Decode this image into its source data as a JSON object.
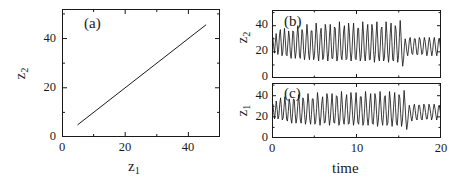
{
  "figure": {
    "width": 466,
    "height": 183,
    "background": "#ffffff",
    "line_color": "#1a1a1a"
  },
  "chart_data": [
    {
      "type": "line",
      "panel_label": "(a)",
      "title": "",
      "xlabel": "z_1",
      "ylabel": "z_2",
      "xlabel_text": "z",
      "xlabel_sub": "1",
      "ylabel_text": "z",
      "ylabel_sub": "2",
      "xlim": [
        0,
        50
      ],
      "ylim": [
        0,
        52
      ],
      "xticks": [
        0,
        20,
        40
      ],
      "xtick_labels": [
        "0",
        "20",
        "40"
      ],
      "xticks_minor": [
        10,
        30,
        50
      ],
      "yticks": [
        0,
        20,
        40
      ],
      "ytick_labels": [
        "0",
        "20",
        "40"
      ],
      "yticks_minor": [
        10,
        30,
        50
      ],
      "grid": false,
      "legend": "none",
      "series": [
        {
          "name": "z2 vs z1",
          "x": [
            5.0,
            45.5
          ],
          "values": [
            5.0,
            45.5
          ]
        }
      ]
    },
    {
      "type": "line",
      "panel_label": "(b)",
      "title": "",
      "xlabel": "",
      "ylabel": "z_2",
      "ylabel_text": "z",
      "ylabel_sub": "2",
      "xlim": [
        0,
        20
      ],
      "ylim": [
        0,
        52
      ],
      "xticks": [
        0,
        10,
        20
      ],
      "xtick_labels": [
        "",
        "",
        ""
      ],
      "xticks_minor": [
        5,
        15
      ],
      "yticks": [
        0,
        20,
        40
      ],
      "ytick_labels": [
        "0",
        "20",
        "40"
      ],
      "yticks_minor": [
        10,
        30,
        50
      ],
      "grid": false,
      "legend": "none",
      "series": [
        {
          "name": "z2(t)",
          "x": [
            0.0,
            0.1,
            0.2,
            0.3,
            0.4,
            0.5,
            0.6,
            0.7,
            0.8,
            0.9,
            1.0,
            1.1,
            1.2,
            1.3,
            1.4,
            1.5,
            1.6,
            1.7,
            1.8,
            1.9,
            2.0,
            2.1,
            2.2,
            2.3,
            2.4,
            2.5,
            2.6,
            2.7,
            2.8,
            2.9,
            3.0,
            3.1,
            3.2,
            3.3,
            3.4,
            3.5,
            3.6,
            3.7,
            3.8,
            3.9,
            4.0,
            4.1,
            4.2,
            4.3,
            4.4,
            4.5,
            4.6,
            4.7,
            4.8,
            4.9,
            5.0,
            5.1,
            5.2,
            5.3,
            5.4,
            5.5,
            5.6,
            5.7,
            5.8,
            5.9,
            6.0,
            6.1,
            6.2,
            6.3,
            6.4,
            6.5,
            6.6,
            6.7,
            6.8,
            6.9,
            7.0,
            7.1,
            7.2,
            7.3,
            7.4,
            7.5,
            7.6,
            7.7,
            7.8,
            7.9,
            8.0,
            8.1,
            8.2,
            8.3,
            8.4,
            8.5,
            8.6,
            8.7,
            8.8,
            8.9,
            9.0,
            9.1,
            9.2,
            9.3,
            9.4,
            9.5,
            9.6,
            9.7,
            9.8,
            9.9,
            10.0,
            10.1,
            10.2,
            10.3,
            10.4,
            10.5,
            10.6,
            10.7,
            10.8,
            10.9,
            11.0,
            11.1,
            11.2,
            11.3,
            11.4,
            11.5,
            11.6,
            11.7,
            11.8,
            11.9,
            12.0,
            12.1,
            12.2,
            12.3,
            12.4,
            12.5,
            12.6,
            12.7,
            12.8,
            12.9,
            13.0,
            13.1,
            13.2,
            13.3,
            13.4,
            13.5,
            13.6,
            13.7,
            13.8,
            13.9,
            14.0,
            14.1,
            14.2,
            14.3,
            14.4,
            14.5,
            14.6,
            14.7,
            14.8,
            14.9,
            15.0,
            15.1,
            15.2,
            15.3,
            15.4,
            15.5,
            15.6,
            15.7,
            15.8,
            15.9,
            16.0,
            16.1,
            16.2,
            16.3,
            16.4,
            16.5,
            16.6,
            16.7,
            16.8,
            16.9,
            17.0,
            17.1,
            17.2,
            17.3,
            17.4,
            17.5,
            17.6,
            17.7,
            17.8,
            17.9,
            18.0,
            18.1,
            18.2,
            18.3,
            18.4,
            18.5,
            18.6,
            18.7,
            18.8,
            18.9,
            19.0,
            19.1,
            19.2,
            19.3,
            19.4,
            19.5,
            19.6,
            19.7,
            19.8,
            19.9,
            20.0
          ],
          "values": [
            28,
            31,
            24,
            19,
            27,
            34,
            26,
            18,
            22,
            33,
            37,
            27,
            17,
            20,
            30,
            38,
            29,
            18,
            17,
            26,
            36,
            31,
            19,
            15,
            24,
            36,
            35,
            22,
            15,
            20,
            32,
            40,
            30,
            17,
            15,
            25,
            37,
            34,
            21,
            14,
            19,
            31,
            41,
            32,
            18,
            14,
            23,
            36,
            36,
            23,
            14,
            17,
            29,
            42,
            34,
            19,
            13,
            21,
            34,
            38,
            25,
            14,
            16,
            27,
            41,
            36,
            21,
            13,
            19,
            32,
            41,
            28,
            15,
            15,
            25,
            39,
            38,
            23,
            13,
            17,
            30,
            43,
            31,
            17,
            14,
            22,
            36,
            40,
            26,
            14,
            15,
            27,
            42,
            35,
            20,
            13,
            19,
            33,
            42,
            29,
            15,
            14,
            24,
            38,
            38,
            23,
            13,
            16,
            29,
            43,
            33,
            18,
            13,
            21,
            35,
            41,
            27,
            14,
            14,
            26,
            41,
            36,
            21,
            12,
            18,
            32,
            43,
            30,
            16,
            13,
            23,
            37,
            39,
            24,
            13,
            15,
            28,
            43,
            34,
            19,
            12,
            20,
            34,
            42,
            28,
            14,
            13,
            25,
            40,
            37,
            22,
            12,
            17,
            31,
            44,
            32,
            17,
            9,
            14,
            24,
            30,
            26,
            20,
            17,
            22,
            29,
            31,
            25,
            19,
            18,
            24,
            30,
            30,
            24,
            18,
            18,
            25,
            31,
            29,
            23,
            18,
            19,
            26,
            31,
            28,
            22,
            17,
            20,
            27,
            31,
            27,
            21,
            17,
            21,
            28,
            31,
            26,
            20,
            17,
            22,
            29,
            30,
            25,
            19
          ]
        }
      ]
    },
    {
      "type": "line",
      "panel_label": "(c)",
      "title": "",
      "xlabel": "time",
      "ylabel": "z_1",
      "ylabel_text": "z",
      "ylabel_sub": "1",
      "xlim": [
        0,
        20
      ],
      "ylim": [
        0,
        52
      ],
      "xticks": [
        0,
        10,
        20
      ],
      "xtick_labels": [
        "0",
        "10",
        "20"
      ],
      "xticks_minor": [
        5,
        15
      ],
      "yticks": [
        0,
        20,
        40
      ],
      "ytick_labels": [
        "0",
        "20",
        "40"
      ],
      "yticks_minor": [
        10,
        30,
        50
      ],
      "grid": false,
      "legend": "none",
      "series": [
        {
          "name": "z1(t)",
          "x": [
            0.0,
            0.1,
            0.2,
            0.3,
            0.4,
            0.5,
            0.6,
            0.7,
            0.8,
            0.9,
            1.0,
            1.1,
            1.2,
            1.3,
            1.4,
            1.5,
            1.6,
            1.7,
            1.8,
            1.9,
            2.0,
            2.1,
            2.2,
            2.3,
            2.4,
            2.5,
            2.6,
            2.7,
            2.8,
            2.9,
            3.0,
            3.1,
            3.2,
            3.3,
            3.4,
            3.5,
            3.6,
            3.7,
            3.8,
            3.9,
            4.0,
            4.1,
            4.2,
            4.3,
            4.4,
            4.5,
            4.6,
            4.7,
            4.8,
            4.9,
            5.0,
            5.1,
            5.2,
            5.3,
            5.4,
            5.5,
            5.6,
            5.7,
            5.8,
            5.9,
            6.0,
            6.1,
            6.2,
            6.3,
            6.4,
            6.5,
            6.6,
            6.7,
            6.8,
            6.9,
            7.0,
            7.1,
            7.2,
            7.3,
            7.4,
            7.5,
            7.6,
            7.7,
            7.8,
            7.9,
            8.0,
            8.1,
            8.2,
            8.3,
            8.4,
            8.5,
            8.6,
            8.7,
            8.8,
            8.9,
            9.0,
            9.1,
            9.2,
            9.3,
            9.4,
            9.5,
            9.6,
            9.7,
            9.8,
            9.9,
            10.0,
            10.1,
            10.2,
            10.3,
            10.4,
            10.5,
            10.6,
            10.7,
            10.8,
            10.9,
            11.0,
            11.1,
            11.2,
            11.3,
            11.4,
            11.5,
            11.6,
            11.7,
            11.8,
            11.9,
            12.0,
            12.1,
            12.2,
            12.3,
            12.4,
            12.5,
            12.6,
            12.7,
            12.8,
            12.9,
            13.0,
            13.1,
            13.2,
            13.3,
            13.4,
            13.5,
            13.6,
            13.7,
            13.8,
            13.9,
            14.0,
            14.1,
            14.2,
            14.3,
            14.4,
            14.5,
            14.6,
            14.7,
            14.8,
            14.9,
            15.0,
            15.1,
            15.2,
            15.3,
            15.4,
            15.5,
            15.6,
            15.7,
            15.8,
            15.9,
            16.0,
            16.1,
            16.2,
            16.3,
            16.4,
            16.5,
            16.6,
            16.7,
            16.8,
            16.9,
            17.0,
            17.1,
            17.2,
            17.3,
            17.4,
            17.5,
            17.6,
            17.7,
            17.8,
            17.9,
            18.0,
            18.1,
            18.2,
            18.3,
            18.4,
            18.5,
            18.6,
            18.7,
            18.8,
            18.9,
            19.0,
            19.1,
            19.2,
            19.3,
            19.4,
            19.5,
            19.6,
            19.7,
            19.8,
            19.9,
            20.0
          ],
          "values": [
            29,
            32,
            24,
            18,
            26,
            35,
            27,
            18,
            21,
            32,
            38,
            28,
            17,
            19,
            29,
            39,
            30,
            18,
            16,
            25,
            37,
            32,
            19,
            14,
            23,
            37,
            36,
            23,
            14,
            19,
            31,
            41,
            31,
            17,
            14,
            24,
            38,
            35,
            22,
            13,
            18,
            30,
            42,
            33,
            18,
            13,
            22,
            37,
            37,
            24,
            13,
            16,
            28,
            43,
            35,
            20,
            12,
            20,
            33,
            39,
            26,
            14,
            15,
            26,
            42,
            37,
            22,
            12,
            18,
            31,
            42,
            29,
            15,
            14,
            24,
            40,
            39,
            24,
            12,
            16,
            29,
            44,
            32,
            18,
            13,
            21,
            35,
            41,
            27,
            13,
            14,
            26,
            43,
            36,
            21,
            12,
            18,
            32,
            43,
            30,
            15,
            13,
            23,
            39,
            39,
            24,
            12,
            15,
            28,
            44,
            34,
            19,
            12,
            20,
            34,
            42,
            28,
            14,
            13,
            25,
            42,
            37,
            22,
            11,
            17,
            31,
            44,
            31,
            17,
            12,
            22,
            38,
            40,
            25,
            12,
            14,
            27,
            44,
            35,
            20,
            11,
            19,
            33,
            43,
            29,
            14,
            12,
            24,
            41,
            38,
            23,
            11,
            16,
            30,
            45,
            33,
            18,
            8,
            13,
            23,
            31,
            27,
            20,
            16,
            21,
            29,
            32,
            26,
            19,
            17,
            23,
            31,
            31,
            25,
            18,
            17,
            24,
            32,
            30,
            24,
            18,
            18,
            25,
            32,
            29,
            23,
            17,
            20,
            27,
            32,
            28,
            22,
            17,
            21,
            29,
            31,
            26,
            19
          ]
        }
      ]
    }
  ]
}
